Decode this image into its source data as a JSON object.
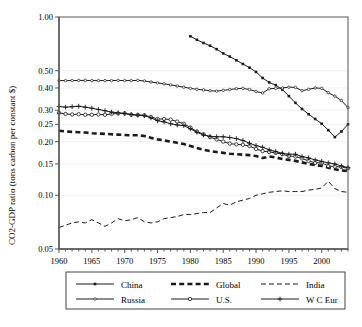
{
  "chart_data": {
    "type": "line",
    "title": "",
    "xlabel": "",
    "ylabel": "CO2-GDP ratio (tons carbon per constant $)",
    "yscale": "log",
    "ylim": [
      0.05,
      1.0
    ],
    "xlim": [
      1960,
      2004
    ],
    "grid": false,
    "legend_position": "bottom",
    "ytick_labels": [
      "1.00",
      "0.50",
      "0.40",
      "0.30",
      "0.25",
      "0.20",
      "0.15",
      "0.10",
      "0.05"
    ],
    "ytick_values": [
      1.0,
      0.5,
      0.4,
      0.3,
      0.25,
      0.2,
      0.15,
      0.1,
      0.05
    ],
    "xtick_labels": [
      "1960",
      "1965",
      "1970",
      "1975",
      "1980",
      "1985",
      "1990",
      "1995",
      "2000"
    ],
    "xtick_values": [
      1960,
      1965,
      1970,
      1975,
      1980,
      1985,
      1990,
      1995,
      2000
    ],
    "xtick_minor_step": 1,
    "series": [
      {
        "name": "China",
        "marker": "square-small",
        "dash": "solid",
        "width": 1,
        "x": [
          1980,
          1981,
          1982,
          1983,
          1984,
          1985,
          1986,
          1987,
          1988,
          1989,
          1990,
          1991,
          1992,
          1993,
          1994,
          1995,
          1996,
          1997,
          1998,
          1999,
          2000,
          2001,
          2002,
          2003,
          2004
        ],
        "values": [
          0.78,
          0.745,
          0.715,
          0.69,
          0.66,
          0.625,
          0.6,
          0.572,
          0.545,
          0.52,
          0.492,
          0.455,
          0.43,
          0.415,
          0.392,
          0.36,
          0.33,
          0.305,
          0.285,
          0.268,
          0.252,
          0.232,
          0.212,
          0.228,
          0.25
        ]
      },
      {
        "name": "Global",
        "marker": "none",
        "dash": "dashed-heavy",
        "width": 2.6,
        "x": [
          1960,
          1961,
          1962,
          1963,
          1964,
          1965,
          1966,
          1967,
          1968,
          1969,
          1970,
          1971,
          1972,
          1973,
          1974,
          1975,
          1976,
          1977,
          1978,
          1979,
          1980,
          1981,
          1982,
          1983,
          1984,
          1985,
          1986,
          1987,
          1988,
          1989,
          1990,
          1991,
          1992,
          1993,
          1994,
          1995,
          1996,
          1997,
          1998,
          1999,
          2000,
          2001,
          2002,
          2003,
          2004
        ],
        "values": [
          0.23,
          0.228,
          0.227,
          0.226,
          0.225,
          0.223,
          0.222,
          0.221,
          0.22,
          0.219,
          0.218,
          0.217,
          0.217,
          0.215,
          0.21,
          0.206,
          0.203,
          0.2,
          0.197,
          0.194,
          0.189,
          0.184,
          0.18,
          0.177,
          0.175,
          0.173,
          0.171,
          0.17,
          0.169,
          0.168,
          0.166,
          0.162,
          0.165,
          0.163,
          0.16,
          0.158,
          0.156,
          0.153,
          0.15,
          0.148,
          0.146,
          0.143,
          0.14,
          0.138,
          0.137
        ]
      },
      {
        "name": "India",
        "marker": "none",
        "dash": "long-dash",
        "width": 1,
        "x": [
          1960,
          1961,
          1962,
          1963,
          1964,
          1965,
          1966,
          1967,
          1968,
          1969,
          1970,
          1971,
          1972,
          1973,
          1974,
          1975,
          1976,
          1977,
          1978,
          1979,
          1980,
          1981,
          1982,
          1983,
          1984,
          1985,
          1986,
          1987,
          1988,
          1989,
          1990,
          1991,
          1992,
          1993,
          1994,
          1995,
          1996,
          1997,
          1998,
          1999,
          2000,
          2001,
          2002,
          2003,
          2004
        ],
        "values": [
          0.066,
          0.068,
          0.07,
          0.071,
          0.07,
          0.073,
          0.07,
          0.067,
          0.07,
          0.074,
          0.072,
          0.073,
          0.075,
          0.071,
          0.07,
          0.071,
          0.074,
          0.075,
          0.076,
          0.078,
          0.078,
          0.079,
          0.08,
          0.08,
          0.085,
          0.09,
          0.088,
          0.092,
          0.094,
          0.096,
          0.1,
          0.102,
          0.104,
          0.105,
          0.106,
          0.105,
          0.105,
          0.105,
          0.107,
          0.108,
          0.11,
          0.12,
          0.109,
          0.105,
          0.104
        ]
      },
      {
        "name": "Russia",
        "marker": "circle-open-small",
        "dash": "solid",
        "width": 1,
        "x": [
          1960,
          1961,
          1962,
          1963,
          1964,
          1965,
          1966,
          1967,
          1968,
          1969,
          1970,
          1971,
          1972,
          1973,
          1974,
          1975,
          1976,
          1977,
          1978,
          1979,
          1980,
          1981,
          1982,
          1983,
          1984,
          1985,
          1986,
          1987,
          1988,
          1989,
          1990,
          1991,
          1992,
          1993,
          1994,
          1995,
          1996,
          1997,
          1998,
          1999,
          2000,
          2001,
          2002,
          2003,
          2004
        ],
        "values": [
          0.44,
          0.44,
          0.44,
          0.441,
          0.441,
          0.44,
          0.44,
          0.44,
          0.44,
          0.441,
          0.44,
          0.44,
          0.441,
          0.438,
          0.432,
          0.427,
          0.422,
          0.416,
          0.41,
          0.404,
          0.398,
          0.393,
          0.39,
          0.386,
          0.384,
          0.388,
          0.392,
          0.396,
          0.398,
          0.392,
          0.382,
          0.375,
          0.396,
          0.398,
          0.4,
          0.404,
          0.403,
          0.386,
          0.393,
          0.4,
          0.398,
          0.376,
          0.36,
          0.34,
          0.31
        ]
      },
      {
        "name": "U.S.",
        "marker": "circle-open",
        "dash": "solid",
        "width": 1,
        "x": [
          1960,
          1961,
          1962,
          1963,
          1964,
          1965,
          1966,
          1967,
          1968,
          1969,
          1970,
          1971,
          1972,
          1973,
          1974,
          1975,
          1976,
          1977,
          1978,
          1979,
          1980,
          1981,
          1982,
          1983,
          1984,
          1985,
          1986,
          1987,
          1988,
          1989,
          1990,
          1991,
          1992,
          1993,
          1994,
          1995,
          1996,
          1997,
          1998,
          1999,
          2000,
          2001,
          2002,
          2003,
          2004
        ],
        "values": [
          0.29,
          0.286,
          0.284,
          0.285,
          0.283,
          0.283,
          0.284,
          0.283,
          0.286,
          0.288,
          0.288,
          0.283,
          0.282,
          0.281,
          0.275,
          0.268,
          0.268,
          0.266,
          0.259,
          0.252,
          0.24,
          0.228,
          0.22,
          0.212,
          0.206,
          0.2,
          0.195,
          0.193,
          0.192,
          0.189,
          0.182,
          0.177,
          0.175,
          0.173,
          0.17,
          0.166,
          0.165,
          0.161,
          0.156,
          0.152,
          0.152,
          0.146,
          0.145,
          0.144,
          0.142
        ]
      },
      {
        "name": "W C Eur",
        "marker": "plus",
        "dash": "solid",
        "width": 1,
        "x": [
          1960,
          1961,
          1962,
          1963,
          1964,
          1965,
          1966,
          1967,
          1968,
          1969,
          1970,
          1971,
          1972,
          1973,
          1974,
          1975,
          1976,
          1977,
          1978,
          1979,
          1980,
          1981,
          1982,
          1983,
          1984,
          1985,
          1986,
          1987,
          1988,
          1989,
          1990,
          1991,
          1992,
          1993,
          1994,
          1995,
          1996,
          1997,
          1998,
          1999,
          2000,
          2001,
          2002,
          2003,
          2004
        ],
        "values": [
          0.315,
          0.312,
          0.314,
          0.316,
          0.312,
          0.308,
          0.303,
          0.298,
          0.293,
          0.29,
          0.288,
          0.284,
          0.282,
          0.28,
          0.272,
          0.262,
          0.258,
          0.252,
          0.248,
          0.246,
          0.236,
          0.226,
          0.218,
          0.214,
          0.213,
          0.213,
          0.211,
          0.208,
          0.203,
          0.196,
          0.19,
          0.186,
          0.18,
          0.176,
          0.172,
          0.17,
          0.17,
          0.165,
          0.162,
          0.158,
          0.155,
          0.152,
          0.15,
          0.146,
          0.143
        ]
      }
    ]
  },
  "legend": {
    "entries": [
      {
        "label": "China",
        "marker": "square-small",
        "dash": "solid"
      },
      {
        "label": "Global",
        "marker": "none",
        "dash": "dashed-heavy"
      },
      {
        "label": "India",
        "marker": "none",
        "dash": "long-dash"
      },
      {
        "label": "Russia",
        "marker": "circle-open-small",
        "dash": "solid"
      },
      {
        "label": "U.S.",
        "marker": "circle-open",
        "dash": "solid"
      },
      {
        "label": "W C Eur",
        "marker": "plus",
        "dash": "solid"
      }
    ]
  },
  "colors": {
    "line": "#1a1a1a",
    "axis": "#555555",
    "background": "#ffffff",
    "grid": "#e8e8e8"
  }
}
